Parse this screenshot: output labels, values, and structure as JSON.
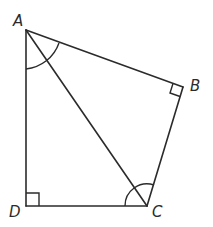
{
  "diagram": {
    "type": "quadrilateral",
    "vertices": [
      {
        "label": "A",
        "x": 26,
        "y": 30
      },
      {
        "label": "B",
        "x": 183,
        "y": 87
      },
      {
        "label": "C",
        "x": 147,
        "y": 206
      },
      {
        "label": "D",
        "x": 26,
        "y": 206
      }
    ],
    "edges": [
      [
        "A",
        "B"
      ],
      [
        "B",
        "C"
      ],
      [
        "C",
        "D"
      ],
      [
        "D",
        "A"
      ],
      [
        "A",
        "C"
      ]
    ],
    "right_angles": [
      "B",
      "D"
    ],
    "equal_angle_arcs": [
      "angle DAC",
      "angle BCA"
    ],
    "colors": {
      "stroke": "#2b2b2b",
      "background": "#ffffff"
    }
  },
  "labels": {
    "A": "A",
    "B": "B",
    "C": "C",
    "D": "D"
  }
}
